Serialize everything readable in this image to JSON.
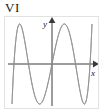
{
  "figure": {
    "roman_label": "VI",
    "background_color": "#ffffff",
    "border_color": "#e2e2e2",
    "axis_color": "#3a3a3a",
    "curve_color": "#8c8c8c"
  },
  "axes": {
    "x_label": "x",
    "y_label": "y",
    "x_arrow": "arrow-right",
    "y_arrow": "arrow-up",
    "origin_x": 47,
    "origin_y": 47
  },
  "chart_data": {
    "type": "line",
    "title": "VI",
    "xlabel": "x",
    "ylabel": "y",
    "grid": false,
    "legend": null,
    "parametric": {
      "x_expression": "A*sin(t)",
      "y_expression": "B*sin(5*t)",
      "a_freq": 1,
      "b_freq": 5,
      "phase": 0,
      "x_amplitude": 40,
      "y_amplitude": 40,
      "t_range": [
        0,
        6.283185307179586
      ],
      "samples": 1200
    },
    "xlim": [
      -1.15,
      1.15
    ],
    "ylim": [
      -1.15,
      1.15
    ],
    "lobe_count": 5,
    "series": [
      {
        "name": "lissajous-1-to-5",
        "color": "#8c8c8c"
      }
    ]
  }
}
